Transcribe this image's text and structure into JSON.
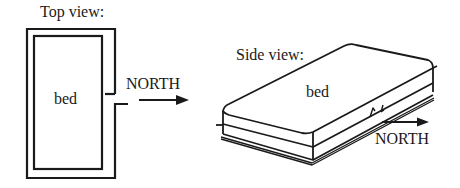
{
  "top_view": {
    "title": "Top view:",
    "object_label": "bed",
    "direction_label": "NORTH"
  },
  "side_view": {
    "title": "Side view:",
    "object_label": "bed",
    "direction_label": "NORTH"
  },
  "colors": {
    "ink": "#1a1a1a",
    "background": "#ffffff"
  }
}
